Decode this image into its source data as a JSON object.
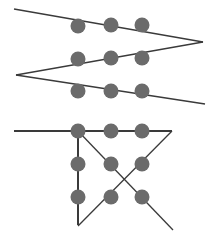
{
  "canvas": {
    "width": 220,
    "height": 245,
    "background": "#ffffff",
    "title": "Dot and line figures"
  },
  "style": {
    "dot_color": "#6b6b6b",
    "line_color": "#3a3a3a",
    "line_width": 1.3,
    "thick_line_width": 2.0,
    "dot_radius": 7.5
  },
  "figures": [
    {
      "id": "top-figure",
      "name": "zigzag-three-line-figure",
      "description": "Three nearly parallel lines joined at left and right vertices forming a sideways zigzag",
      "lines": [
        {
          "id": "top-line",
          "name": "zigzag-segment-1",
          "x1": 14,
          "y1": 9,
          "x2": 203,
          "y2": 42,
          "width": 1.3
        },
        {
          "id": "middle-line",
          "name": "zigzag-segment-2",
          "x1": 203,
          "y1": 42,
          "x2": 16,
          "y2": 75,
          "width": 1.3
        },
        {
          "id": "bottom-line",
          "name": "zigzag-segment-3",
          "x1": 16,
          "y1": 75,
          "x2": 205,
          "y2": 104,
          "width": 1.3
        }
      ],
      "dots": [
        {
          "id": "dot-r1c1",
          "name": "dot-row1-col1",
          "cx": 78,
          "cy": 26
        },
        {
          "id": "dot-r1c2",
          "name": "dot-row1-col2",
          "cx": 111,
          "cy": 25
        },
        {
          "id": "dot-r1c3",
          "name": "dot-row1-col3",
          "cx": 142,
          "cy": 25
        },
        {
          "id": "dot-r2c1",
          "name": "dot-row2-col1",
          "cx": 78,
          "cy": 59
        },
        {
          "id": "dot-r2c2",
          "name": "dot-row2-col2",
          "cx": 111,
          "cy": 58
        },
        {
          "id": "dot-r2c3",
          "name": "dot-row2-col3",
          "cx": 142,
          "cy": 58
        },
        {
          "id": "dot-r3c1",
          "name": "dot-row3-col1",
          "cx": 78,
          "cy": 91
        },
        {
          "id": "dot-r3c2",
          "name": "dot-row3-col2",
          "cx": 111,
          "cy": 91
        },
        {
          "id": "dot-r3c3",
          "name": "dot-row3-col3",
          "cx": 142,
          "cy": 91
        }
      ]
    },
    {
      "id": "bottom-figure",
      "name": "cross-and-angle-figure",
      "description": "Horizontal line, vertical line and an X of two crossing diagonals over a three by three dot grid",
      "lines": [
        {
          "id": "horizontal-line",
          "name": "horizontal-segment",
          "x1": 14,
          "y1": 131,
          "x2": 172,
          "y2": 131,
          "width": 1.8
        },
        {
          "id": "vertical-line",
          "name": "vertical-segment",
          "x1": 78,
          "y1": 131,
          "x2": 78,
          "y2": 225,
          "width": 2.0
        },
        {
          "id": "diagonal-down",
          "name": "diagonal-down-right",
          "x1": 78,
          "y1": 131,
          "x2": 173,
          "y2": 230,
          "width": 1.3
        },
        {
          "id": "diagonal-up",
          "name": "diagonal-down-left",
          "x1": 172,
          "y1": 131,
          "x2": 78,
          "y2": 226,
          "width": 1.3
        }
      ],
      "dots": [
        {
          "id": "bdot-r1c1",
          "name": "dot-row1-col1",
          "cx": 78,
          "cy": 131
        },
        {
          "id": "bdot-r1c2",
          "name": "dot-row1-col2",
          "cx": 111,
          "cy": 131
        },
        {
          "id": "bdot-r1c3",
          "name": "dot-row1-col3",
          "cx": 142,
          "cy": 131
        },
        {
          "id": "bdot-r2c1",
          "name": "dot-row2-col1",
          "cx": 78,
          "cy": 164
        },
        {
          "id": "bdot-r2c2",
          "name": "dot-row2-col2",
          "cx": 111,
          "cy": 164
        },
        {
          "id": "bdot-r2c3",
          "name": "dot-row2-col3",
          "cx": 142,
          "cy": 164
        },
        {
          "id": "bdot-r3c1",
          "name": "dot-row3-col1",
          "cx": 78,
          "cy": 197
        },
        {
          "id": "bdot-r3c2",
          "name": "dot-row3-col2",
          "cx": 111,
          "cy": 197
        },
        {
          "id": "bdot-r3c3",
          "name": "dot-row3-col3",
          "cx": 142,
          "cy": 197
        }
      ]
    }
  ]
}
